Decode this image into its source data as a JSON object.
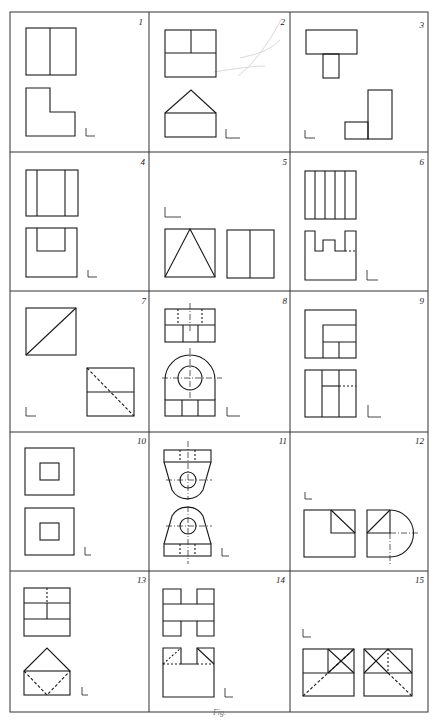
{
  "sheet": {
    "title": "Orthographic projection exercise sheet",
    "grid": {
      "columns": 3,
      "rows": 5,
      "x": [
        10,
        149,
        290,
        428
      ],
      "y": [
        12,
        152,
        291,
        432,
        571,
        712
      ]
    },
    "line_color": "#1a1a1a",
    "border_color": "#333333",
    "caption": "Fig."
  },
  "problems": [
    {
      "number": "1",
      "views": [
        "square split vertically in half",
        "L-shaped profile"
      ],
      "axis_mark": "L"
    },
    {
      "number": "2",
      "views": [
        "rectangle with upper half split",
        "pentagon (house shape)"
      ],
      "axis_mark": "L"
    },
    {
      "number": "3",
      "views": [
        "T shape",
        "stepped L shape"
      ],
      "axis_mark": "L"
    },
    {
      "number": "4",
      "views": [
        "rectangle with two vertical lines",
        "U-shaped slot"
      ],
      "axis_mark": "L"
    },
    {
      "number": "5",
      "views": [
        "triangle in square",
        "square split vertically"
      ],
      "axis_mark": "L"
    },
    {
      "number": "6",
      "views": [
        "rectangle with four vertical divisions",
        "castellated profile with hidden line"
      ],
      "axis_mark": "L"
    },
    {
      "number": "7",
      "views": [
        "square with diagonal",
        "rectangle with horizontal line and hidden diagonal"
      ],
      "axis_mark": "L"
    },
    {
      "number": "8",
      "views": [
        "rectangle with hidden holes and centerline",
        "arched bracket with circle hole"
      ],
      "axis_mark": "L"
    },
    {
      "number": "9",
      "views": [
        "square with stepped corner",
        "rectangle divided with hidden line"
      ],
      "axis_mark": "L"
    },
    {
      "number": "10",
      "views": [
        "square with inner square",
        "square with inner square"
      ],
      "axis_mark": "L"
    },
    {
      "number": "11",
      "views": [
        "inverted tapered bracket with hole",
        "tapered bracket with hole"
      ],
      "axis_mark": "L"
    },
    {
      "number": "12",
      "views": [
        "square with diagonal-corner cutout",
        "square with quarter-round extension"
      ],
      "axis_mark": "L"
    },
    {
      "number": "13",
      "views": [
        "rectangle divided into grid with hidden line",
        "pentagon with hidden diagonals"
      ],
      "axis_mark": "L"
    },
    {
      "number": "14",
      "views": [
        "cross shape",
        "U shape with chamfered corners"
      ],
      "axis_mark": "L"
    },
    {
      "number": "15",
      "views": [
        "rectangle with X in corner cell",
        "rectangle with X and hidden diagonal"
      ],
      "axis_mark": "L"
    }
  ]
}
